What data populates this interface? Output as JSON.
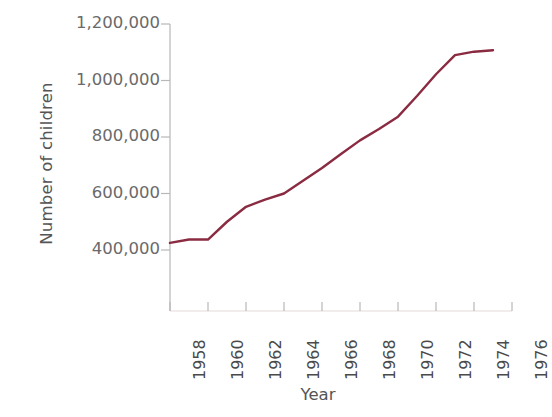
{
  "chart_data": {
    "type": "line",
    "title": "",
    "subtitle": "",
    "xlabel": "Year",
    "ylabel": "Number of children",
    "xlim": [
      1958,
      1976
    ],
    "ylim": [
      300000,
      1200000
    ],
    "grid": false,
    "legend": null,
    "annotations": [],
    "line_color": "#8a2b41",
    "axis_color": "#b8b8b8",
    "x_tick_labels": [
      "1958",
      "1960",
      "1962",
      "1964",
      "1966",
      "1968",
      "1970",
      "1972",
      "1974",
      "1976"
    ],
    "x_ticks": [
      1958,
      1960,
      1962,
      1964,
      1966,
      1968,
      1970,
      1972,
      1974,
      1976
    ],
    "y_tick_labels": [
      "400,000",
      "600,000",
      "800,000",
      "1,000,000",
      "1,200,000"
    ],
    "y_ticks": [
      400000,
      600000,
      800000,
      1000000,
      1200000
    ],
    "x": [
      1958,
      1959,
      1960,
      1961,
      1962,
      1963,
      1964,
      1965,
      1966,
      1967,
      1968,
      1969,
      1970,
      1971,
      1972,
      1973,
      1974,
      1975
    ],
    "values": [
      425000,
      437000,
      437000,
      500000,
      553000,
      578000,
      600000,
      645000,
      690000,
      740000,
      788000,
      828000,
      872000,
      945000,
      1022000,
      1090000,
      1102000,
      1107000
    ],
    "series": [
      {
        "name": "Number of children",
        "values": [
          425000,
          437000,
          437000,
          500000,
          553000,
          578000,
          600000,
          645000,
          690000,
          740000,
          788000,
          828000,
          872000,
          945000,
          1022000,
          1090000,
          1102000,
          1107000
        ]
      }
    ]
  },
  "axes": {
    "y_title": "Number of children",
    "x_title": "Year"
  }
}
